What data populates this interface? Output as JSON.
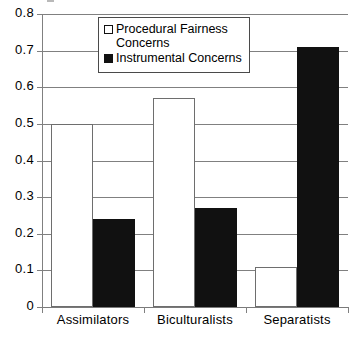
{
  "chart_data": {
    "type": "bar",
    "title": "",
    "xlabel": "",
    "ylabel": "",
    "ylim": [
      0,
      0.8
    ],
    "ytick_labels": [
      "0.8",
      "0.7",
      "0.6",
      "0.5",
      "0.4",
      "0.3",
      "0.2",
      "0.1",
      "0"
    ],
    "ytick_values": [
      0.8,
      0.7,
      0.6,
      0.5,
      0.4,
      0.3,
      0.2,
      0.1,
      0
    ],
    "grid": true,
    "legend_position": "top-center",
    "categories": [
      "Assimilators",
      "Biculturalists",
      "Separatists"
    ],
    "series": [
      {
        "name": "Procedural Fairness Concerns",
        "legend_label_line1": "Procedural Fairness",
        "legend_label_line2": "Concerns",
        "swatch": "open-square",
        "color": "#ffffff",
        "values": [
          0.5,
          0.57,
          0.11
        ]
      },
      {
        "name": "Instrumental  Concerns",
        "legend_label_line1": "Instrumental  Concerns",
        "legend_label_line2": "",
        "swatch": "filled-square",
        "color": "#111111",
        "values": [
          0.24,
          0.27,
          0.71
        ]
      }
    ]
  }
}
